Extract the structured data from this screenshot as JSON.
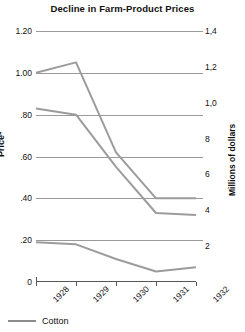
{
  "chart_data": {
    "type": "line",
    "title": "Decline in Farm-Product Prices",
    "xlabel": "",
    "ylabel": "Price*",
    "ylabel_right": "Millions of dollars",
    "x": [
      "1928",
      "1929",
      "1930",
      "1931",
      "1932"
    ],
    "categories": [
      "1928",
      "1929",
      "1930",
      "1931",
      "1932"
    ],
    "ylim": [
      0,
      1.2
    ],
    "ylim_right": [
      0,
      1400
    ],
    "grid": true,
    "legend_position": "bottom-left",
    "yticks": [
      "0",
      ".20",
      ".40",
      ".60",
      ".80",
      "1.00",
      "1.20"
    ],
    "ytick_values": [
      0,
      0.2,
      0.4,
      0.6,
      0.8,
      1.0,
      1.2
    ],
    "yticks_right": [
      "2",
      "4",
      "6",
      "8",
      "1,0",
      "1,2",
      "1,4"
    ],
    "ytick_right_values": [
      200,
      400,
      600,
      800,
      1000,
      1200,
      1400
    ],
    "series": [
      {
        "name": "Series 1",
        "values": [
          1.0,
          1.05,
          0.62,
          0.4,
          0.4
        ],
        "color": "#9c9c9c"
      },
      {
        "name": "Series 2",
        "values": [
          0.83,
          0.8,
          0.55,
          0.33,
          0.32
        ],
        "color": "#9c9c9c"
      },
      {
        "name": "Series 3",
        "values": [
          0.19,
          0.18,
          0.11,
          0.05,
          0.07
        ],
        "color": "#9c9c9c"
      }
    ],
    "legend": [
      {
        "label": "Cotton",
        "color": "#8c8c8c"
      }
    ]
  },
  "colors": {
    "line": "#9c9c9c",
    "grid": "#9a9a9a",
    "axis": "#555555",
    "text": "#111111",
    "background": "#ffffff"
  }
}
